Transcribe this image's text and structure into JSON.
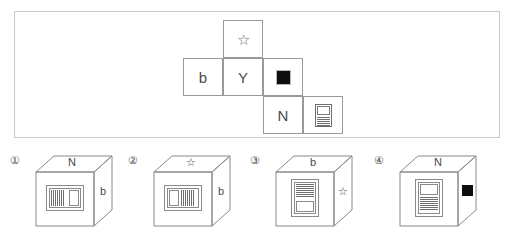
{
  "panel": {
    "name": "cube-net-panel"
  },
  "net": {
    "cells": [
      {
        "id": "star-cell",
        "symbol": "star",
        "text": "☆",
        "row": 0,
        "col": 1
      },
      {
        "id": "b-cell",
        "symbol": "letter-b",
        "text": "b",
        "row": 1,
        "col": 0
      },
      {
        "id": "y-cell",
        "symbol": "letter-y",
        "text": "Y",
        "row": 1,
        "col": 1
      },
      {
        "id": "square-cell",
        "symbol": "black-square",
        "text": "",
        "row": 1,
        "col": 2
      },
      {
        "id": "n-cell",
        "symbol": "letter-n",
        "text": "N",
        "row": 2,
        "col": 2
      },
      {
        "id": "doc-cell",
        "symbol": "document-icon",
        "text": "",
        "row": 2,
        "col": 3
      }
    ]
  },
  "options": [
    {
      "number": "①",
      "top_face": "N",
      "right_face": "b",
      "front_face": "document-icon-rotated-lines-left"
    },
    {
      "number": "②",
      "top_face": "☆",
      "right_face": "b",
      "front_face": "document-icon-rotated-lines-right"
    },
    {
      "number": "③",
      "top_face": "b",
      "right_face": "☆",
      "front_face": "document-icon-lines-top"
    },
    {
      "number": "④",
      "top_face": "N",
      "right_face": "black-square",
      "front_face": "document-icon-lines-bottom"
    }
  ],
  "colors": {
    "panel_border": "#c9c9c9",
    "cell_border": "#9a9a9a",
    "ink": "#4a4a4a",
    "black_fill": "#0d0d0d"
  }
}
